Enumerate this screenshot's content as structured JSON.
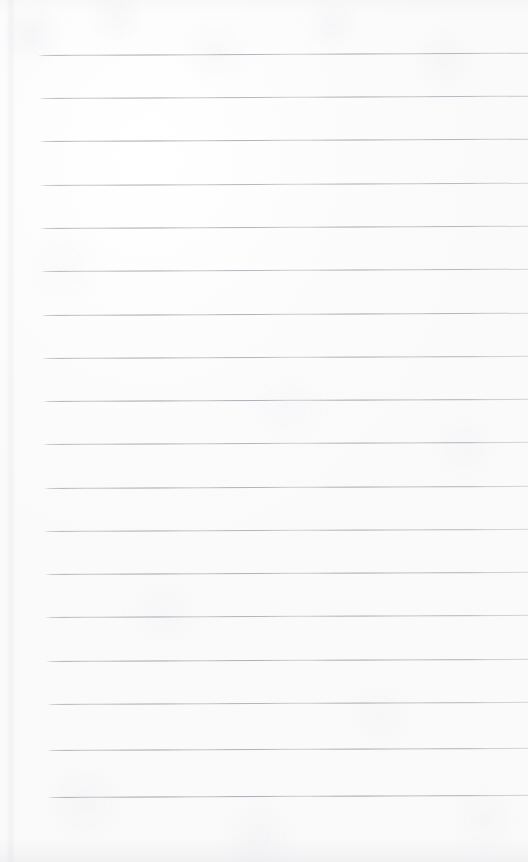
{
  "document": {
    "kind": "scanned-lined-paper",
    "title": "Lined notebook page",
    "content_text": "",
    "page_width": 528,
    "page_height": 862,
    "is_blank": "true",
    "background_color": "#fdfdfd",
    "paper_tint": "#fcfcfd",
    "scan_noise_color": "#b0b2b8"
  },
  "ruling": {
    "line_color": "#8c8e97",
    "line_thickness": 1,
    "line_count": 18,
    "line_spacing": 43.6,
    "first_line_y": 55,
    "last_line_y": 797,
    "skew_degrees": -0.26,
    "left_start_top": 38,
    "left_start_bottom": 48,
    "right_end": 528,
    "lines": [
      {
        "index": 1,
        "y": 55,
        "x_start": 38,
        "x_end": 528,
        "opacity": 0.86
      },
      {
        "index": 2,
        "y": 98,
        "x_start": 39,
        "x_end": 528,
        "opacity": 0.84
      },
      {
        "index": 3,
        "y": 141,
        "x_start": 39,
        "x_end": 528,
        "opacity": 0.88
      },
      {
        "index": 4,
        "y": 185,
        "x_start": 40,
        "x_end": 528,
        "opacity": 0.82
      },
      {
        "index": 5,
        "y": 228,
        "x_start": 40,
        "x_end": 528,
        "opacity": 0.87
      },
      {
        "index": 6,
        "y": 271,
        "x_start": 41,
        "x_end": 528,
        "opacity": 0.83
      },
      {
        "index": 7,
        "y": 315,
        "x_start": 41,
        "x_end": 528,
        "opacity": 0.88
      },
      {
        "index": 8,
        "y": 358,
        "x_start": 42,
        "x_end": 528,
        "opacity": 0.85
      },
      {
        "index": 9,
        "y": 401,
        "x_start": 43,
        "x_end": 528,
        "opacity": 0.9
      },
      {
        "index": 10,
        "y": 444,
        "x_start": 43,
        "x_end": 528,
        "opacity": 0.84
      },
      {
        "index": 11,
        "y": 488,
        "x_start": 44,
        "x_end": 528,
        "opacity": 0.87
      },
      {
        "index": 12,
        "y": 531,
        "x_start": 44,
        "x_end": 528,
        "opacity": 0.83
      },
      {
        "index": 13,
        "y": 574,
        "x_start": 45,
        "x_end": 528,
        "opacity": 0.88
      },
      {
        "index": 14,
        "y": 617,
        "x_start": 45,
        "x_end": 528,
        "opacity": 0.85
      },
      {
        "index": 15,
        "y": 661,
        "x_start": 46,
        "x_end": 528,
        "opacity": 0.89
      },
      {
        "index": 16,
        "y": 704,
        "x_start": 47,
        "x_end": 528,
        "opacity": 0.84
      },
      {
        "index": 17,
        "y": 750,
        "x_start": 47,
        "x_end": 528,
        "opacity": 0.88
      },
      {
        "index": 18,
        "y": 797,
        "x_start": 48,
        "x_end": 528,
        "opacity": 0.92
      }
    ]
  },
  "margins": {
    "top_blank_height": 55,
    "bottom_blank_height": 65,
    "left_blank_width": 40
  }
}
